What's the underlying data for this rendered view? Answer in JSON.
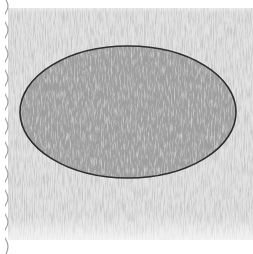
{
  "image": {
    "description": "Pencil sketch of a gray shaded ellipse on hatched paper with a wavy torn left edge",
    "subject": "ellipse",
    "colors": {
      "background": "#ffffff",
      "paper_hatch": "#c8c8c8",
      "ellipse_fill": "#9e9e9e",
      "ellipse_outline": "#2e2e2e",
      "torn_edge": "#a0a0a0"
    },
    "ellipse": {
      "cx": 128,
      "cy": 112,
      "rx": 108,
      "ry": 66
    }
  }
}
